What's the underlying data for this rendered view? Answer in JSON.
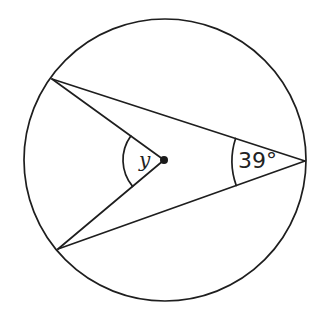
{
  "diagram": {
    "type": "circle-theorem",
    "circle": {
      "cx": 165,
      "cy": 160,
      "r": 141
    },
    "center_point": {
      "x": 164,
      "y": 160,
      "r": 4
    },
    "points": {
      "upper_left": {
        "x": 52,
        "y": 79
      },
      "lower_left": {
        "x": 58,
        "y": 249
      },
      "right": {
        "x": 305,
        "y": 161
      }
    },
    "angles": {
      "center_angle": {
        "label": "y",
        "arc_radius": 41
      },
      "circumference_angle": {
        "label": "39°",
        "value_degrees": 39,
        "arc_radius": 73
      }
    },
    "colors": {
      "line": "#1e1e1e",
      "background": "#ffffff"
    }
  }
}
